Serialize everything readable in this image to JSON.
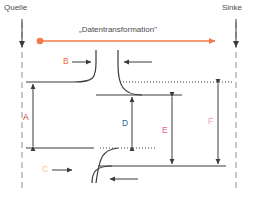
{
  "diagram": {
    "title": "„Datentransformation\"",
    "endpoints": {
      "source_label": "Quelle",
      "sink_label": "Sinke"
    },
    "segment_labels": [
      {
        "id": "A",
        "text": "A",
        "color": "#c0392b"
      },
      {
        "id": "B",
        "text": "B",
        "color": "#f06a3c"
      },
      {
        "id": "C",
        "text": "C",
        "color": "#f2c48a"
      },
      {
        "id": "D",
        "text": "D",
        "color": "#2c5f9e"
      },
      {
        "id": "E",
        "text": "E",
        "color": "#f2607f"
      },
      {
        "id": "F",
        "text": "F",
        "color": "#e4a0b4"
      }
    ],
    "colors": {
      "flow_arrow": "#f4784a",
      "line": "#3a3a3a",
      "dashed_guide": "#9a9a9a",
      "text": "#4d4d4d",
      "background": "#ffffff"
    }
  }
}
